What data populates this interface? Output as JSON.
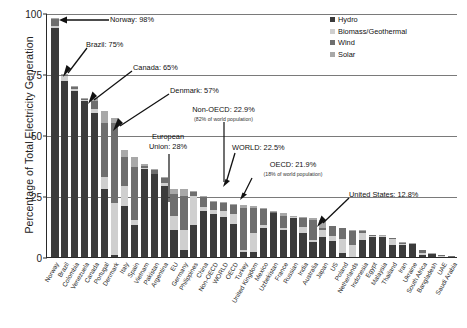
{
  "chart_data": {
    "type": "bar",
    "stacked": true,
    "title": "",
    "xlabel": "",
    "ylabel": "Percentage of Total Electricity Generation",
    "ylim": [
      0,
      100
    ],
    "yticks": [
      0,
      25,
      50,
      75,
      100
    ],
    "grid": true,
    "legend_position": "top-right",
    "series": [
      {
        "name": "Hydro",
        "color": "#3b3b3b"
      },
      {
        "name": "Biomass/Geothermal",
        "color": "#cfcfcf"
      },
      {
        "name": "Wind",
        "color": "#6e6e6e"
      },
      {
        "name": "Solar",
        "color": "#a8a8a8"
      }
    ],
    "categories": [
      "Norway",
      "Brazil",
      "Colombia",
      "Venezuela",
      "Canada",
      "Portugal",
      "Denmark",
      "Italy",
      "Spain",
      "Vietnam",
      "Pakistan",
      "Argentina",
      "EU",
      "Germany",
      "Philippines",
      "China",
      "Non-OECD",
      "WORLD",
      "OECD",
      "Turkey",
      "United Kingdom",
      "Mexico",
      "Uzbekistan",
      "France",
      "Russian",
      "India",
      "Australia",
      "Japan",
      "US",
      "Poland",
      "Netherlands",
      "Indonesia",
      "Egypt",
      "Malaysia",
      "Thailand",
      "Iran",
      "Ukraine",
      "South Africa",
      "Bangladesh",
      "UAE",
      "Saudi Arabia"
    ],
    "totals": [
      98,
      75,
      70,
      65,
      65,
      60,
      57,
      44,
      41,
      38,
      36,
      33,
      28,
      28,
      27,
      25,
      22.9,
      22.5,
      21.9,
      21.5,
      21,
      20,
      19,
      18,
      17,
      16.5,
      16,
      15,
      12.8,
      12,
      11,
      11,
      9,
      9,
      8,
      6,
      5.5,
      3,
      1.5,
      1,
      0.5
    ],
    "values": {
      "Hydro": [
        94,
        72,
        68,
        64,
        59,
        28,
        1,
        21,
        13,
        36,
        34,
        29,
        11,
        3,
        13,
        19,
        17.5,
        16.5,
        13.5,
        2,
        2,
        12,
        18,
        11,
        16,
        10,
        6,
        8,
        6.4,
        1.5,
        0,
        7,
        8,
        8,
        5,
        5,
        5.2,
        1,
        1.2,
        0,
        0
      ],
      "Biomass/Geothermal": [
        0.5,
        2,
        1,
        0.5,
        1.5,
        5,
        21,
        8,
        2,
        0.5,
        0,
        1.5,
        6,
        8,
        12,
        1.5,
        1.8,
        2.4,
        4,
        1,
        8,
        1,
        0,
        1,
        0.3,
        2.5,
        1,
        3,
        2.2,
        6,
        5,
        3,
        0.5,
        0.5,
        2.5,
        0.3,
        0.1,
        0.5,
        0.1,
        0.5,
        0
      ],
      "Wind": [
        3,
        0.5,
        0.5,
        0.3,
        3.5,
        22,
        33,
        12,
        22,
        1,
        1.5,
        2,
        9,
        14,
        1.5,
        4,
        3.2,
        3.2,
        3.8,
        17,
        10,
        6.5,
        0.5,
        5,
        0.2,
        3.5,
        8,
        1,
        4,
        4.3,
        5.8,
        0.8,
        0.4,
        0.3,
        0.3,
        0.5,
        0.2,
        1.4,
        0.1,
        0.3,
        0.3
      ],
      "Solar": [
        0.5,
        0.5,
        0.5,
        0.2,
        1,
        5,
        2,
        3,
        4,
        0.5,
        0.5,
        0.5,
        2,
        3,
        0.5,
        0.5,
        0.4,
        0.4,
        0.6,
        1.5,
        1,
        0.5,
        0.5,
        1,
        0.5,
        0.5,
        1,
        3,
        0.2,
        0.2,
        0.2,
        0.2,
        0.1,
        0.2,
        0.2,
        0.2,
        0.2,
        0.1,
        0.1,
        0.2,
        0.2
      ]
    },
    "annotations": [
      {
        "text": "Norway: 98%",
        "sub": ""
      },
      {
        "text": "Brazil: 75%",
        "sub": ""
      },
      {
        "text": "Canada: 65%",
        "sub": ""
      },
      {
        "text": "Denmark: 57%",
        "sub": ""
      },
      {
        "text": "European\nUnion: 28%",
        "sub": ""
      },
      {
        "text": "Non-OECD: 22.9%",
        "sub": "(82% of world population)"
      },
      {
        "text": "WORLD: 22.5%",
        "sub": ""
      },
      {
        "text": "OECD: 21.9%",
        "sub": "(18% of world population)"
      },
      {
        "text": "United States: 12.8%",
        "sub": ""
      }
    ]
  },
  "annotations": {
    "norway": {
      "label": "Norway: 98%"
    },
    "brazil": {
      "label": "Brazil: 75%"
    },
    "canada": {
      "label": "Canada: 65%"
    },
    "denmark": {
      "label": "Denmark: 57%"
    },
    "eu_line1": {
      "label": "European"
    },
    "eu_line2": {
      "label": "Union: 28%"
    },
    "nonoecd": {
      "label": "Non-OECD: 22.9%",
      "sub": "(82% of world population)"
    },
    "world": {
      "label": "WORLD: 22.5%"
    },
    "oecd": {
      "label": "OECD: 21.9%",
      "sub": "(18% of world population)"
    },
    "usa": {
      "label": "United States: 12.8%"
    }
  }
}
